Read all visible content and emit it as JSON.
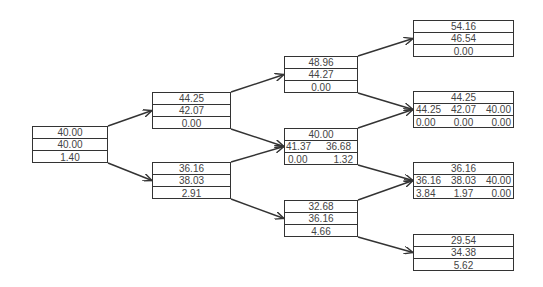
{
  "diagram": {
    "type": "binomial-tree",
    "edge_color": "#333333",
    "nodes": [
      {
        "id": "n0",
        "level": 0,
        "x": 32,
        "y": 126,
        "w": 76,
        "rows": [
          [
            "40.00"
          ],
          [
            "40.00"
          ],
          [
            "1.40"
          ]
        ]
      },
      {
        "id": "n1u",
        "level": 1,
        "x": 152,
        "y": 92,
        "w": 79,
        "rows": [
          [
            "44.25"
          ],
          [
            "42.07"
          ],
          [
            "0.00"
          ]
        ]
      },
      {
        "id": "n1d",
        "level": 1,
        "x": 152,
        "y": 162,
        "w": 79,
        "rows": [
          [
            "36.16"
          ],
          [
            "38.03"
          ],
          [
            "2.91"
          ]
        ]
      },
      {
        "id": "n2uu",
        "level": 2,
        "x": 284,
        "y": 56,
        "w": 74,
        "rows": [
          [
            "48.96"
          ],
          [
            "44.27"
          ],
          [
            "0.00"
          ]
        ]
      },
      {
        "id": "n2ud",
        "level": 2,
        "x": 284,
        "y": 128,
        "w": 74,
        "rows": [
          [
            "40.00"
          ],
          [
            "41.37",
            "36.68"
          ],
          [
            "0.00",
            "1.32"
          ]
        ]
      },
      {
        "id": "n2dd",
        "level": 2,
        "x": 284,
        "y": 200,
        "w": 74,
        "rows": [
          [
            "32.68"
          ],
          [
            "36.16"
          ],
          [
            "4.66"
          ]
        ]
      },
      {
        "id": "n3a",
        "level": 3,
        "x": 413,
        "y": 20,
        "w": 101,
        "rows": [
          [
            "54.16"
          ],
          [
            "46.54"
          ],
          [
            "0.00"
          ]
        ]
      },
      {
        "id": "n3b",
        "level": 3,
        "x": 413,
        "y": 91,
        "w": 101,
        "rows": [
          [
            "44.25"
          ],
          [
            "44.25",
            "42.07",
            "40.00"
          ],
          [
            "0.00",
            "0.00",
            "0.00"
          ]
        ]
      },
      {
        "id": "n3c",
        "level": 3,
        "x": 413,
        "y": 162,
        "w": 101,
        "rows": [
          [
            "36.16"
          ],
          [
            "36.16",
            "38.03",
            "40.00"
          ],
          [
            "3.84",
            "1.97",
            "0.00"
          ]
        ]
      },
      {
        "id": "n3d",
        "level": 3,
        "x": 413,
        "y": 234,
        "w": 101,
        "rows": [
          [
            "29.54"
          ],
          [
            "34.38"
          ],
          [
            "5.62"
          ]
        ]
      }
    ],
    "edges": [
      {
        "from": "n0",
        "to": "n1u"
      },
      {
        "from": "n0",
        "to": "n1d"
      },
      {
        "from": "n1u",
        "to": "n2uu"
      },
      {
        "from": "n1u",
        "to": "n2ud"
      },
      {
        "from": "n1d",
        "to": "n2ud"
      },
      {
        "from": "n1d",
        "to": "n2dd"
      },
      {
        "from": "n2uu",
        "to": "n3a"
      },
      {
        "from": "n2uu",
        "to": "n3b"
      },
      {
        "from": "n2ud",
        "to": "n3b"
      },
      {
        "from": "n2ud",
        "to": "n3c"
      },
      {
        "from": "n2dd",
        "to": "n3c"
      },
      {
        "from": "n2dd",
        "to": "n3d"
      }
    ]
  }
}
